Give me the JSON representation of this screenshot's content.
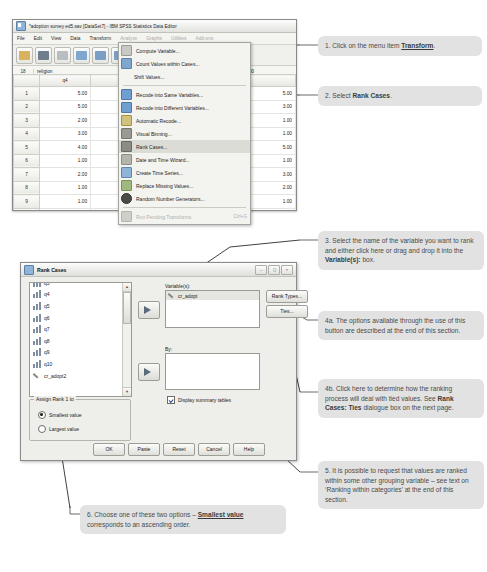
{
  "spss_window": {
    "title": "*adoption survey ed5.sav [DataSet7] - IBM SPSS Statistics Data Editor",
    "title_icon": "spss-data-icon",
    "menus": [
      {
        "label": "File",
        "dim": false
      },
      {
        "label": "Edit",
        "dim": false
      },
      {
        "label": "View",
        "dim": false
      },
      {
        "label": "Data",
        "dim": false
      },
      {
        "label": "Transform",
        "dim": false
      },
      {
        "label": "Analyze",
        "dim": true
      },
      {
        "label": "Graphs",
        "dim": true
      },
      {
        "label": "Utilities",
        "dim": true
      },
      {
        "label": "Add-ons",
        "dim": true
      }
    ],
    "toolbar_icons": [
      "open-file-icon",
      "save-icon",
      "print-icon",
      "recall-dialog-icon",
      "undo-icon",
      "redo-icon",
      "goto-case-icon",
      "variables-icon",
      "find-icon"
    ],
    "cell_bar": {
      "row_ref": "18",
      "variable": "religion",
      "value": "3.00"
    },
    "grid": {
      "columns": [
        "q4"
      ],
      "rows": [
        {
          "num": "1",
          "q4": "5.00",
          "right": "5.00"
        },
        {
          "num": "2",
          "q4": "5.00",
          "right": "3.00"
        },
        {
          "num": "3",
          "q4": "2.00",
          "right": "1.00"
        },
        {
          "num": "4",
          "q4": "3.00",
          "right": "1.00"
        },
        {
          "num": "5",
          "q4": "4.00",
          "right": "5.00"
        },
        {
          "num": "6",
          "q4": "1.00",
          "right": "1.00"
        },
        {
          "num": "7",
          "q4": "2.00",
          "right": "3.00"
        },
        {
          "num": "8",
          "q4": "1.00",
          "right": "2.00"
        },
        {
          "num": "9",
          "q4": "1.00",
          "right": "1.00"
        },
        {
          "num": "10",
          "q4": "2.00",
          "right": "3.00"
        },
        {
          "num": "11",
          "q4": "5.00",
          "right": "5.00"
        },
        {
          "num": "12",
          "q4": "2.00",
          "right": "3.00"
        }
      ],
      "last_row_extra": [
        "4.00",
        "3.00",
        "4.00"
      ]
    }
  },
  "transform_menu": {
    "items": [
      {
        "label": "Compute Variable...",
        "icon": "compute-variable-icon",
        "selected": false,
        "disabled": false,
        "sep_after": false,
        "shortcut": ""
      },
      {
        "label": "Count Values within Cases...",
        "icon": "count-values-icon",
        "selected": false,
        "disabled": false,
        "sep_after": false,
        "shortcut": ""
      },
      {
        "label": "Shift Values...",
        "icon": "none",
        "selected": false,
        "disabled": false,
        "sep_after": true,
        "shortcut": ""
      },
      {
        "label": "Recode into Same Variables...",
        "icon": "recode-same-icon",
        "selected": false,
        "disabled": false,
        "sep_after": false,
        "shortcut": ""
      },
      {
        "label": "Recode into Different Variables...",
        "icon": "recode-different-icon",
        "selected": false,
        "disabled": false,
        "sep_after": false,
        "shortcut": ""
      },
      {
        "label": "Automatic Recode...",
        "icon": "automatic-recode-icon",
        "selected": false,
        "disabled": false,
        "sep_after": false,
        "shortcut": ""
      },
      {
        "label": "Visual Binning...",
        "icon": "visual-binning-icon",
        "selected": false,
        "disabled": false,
        "sep_after": false,
        "shortcut": ""
      },
      {
        "label": "Rank Cases...",
        "icon": "rank-cases-icon",
        "selected": true,
        "disabled": false,
        "sep_after": false,
        "shortcut": ""
      },
      {
        "label": "Date and Time Wizard...",
        "icon": "date-time-wizard-icon",
        "selected": false,
        "disabled": false,
        "sep_after": false,
        "shortcut": ""
      },
      {
        "label": "Create Time Series...",
        "icon": "create-time-series-icon",
        "selected": false,
        "disabled": false,
        "sep_after": false,
        "shortcut": ""
      },
      {
        "label": "Replace Missing Values...",
        "icon": "replace-missing-icon",
        "selected": false,
        "disabled": false,
        "sep_after": false,
        "shortcut": ""
      },
      {
        "label": "Random Number Generators...",
        "icon": "random-number-icon",
        "selected": false,
        "disabled": false,
        "sep_after": true,
        "shortcut": ""
      },
      {
        "label": "Run Pending Transforms",
        "icon": "run-pending-icon",
        "selected": false,
        "disabled": true,
        "sep_after": false,
        "shortcut": "Ctrl+G"
      }
    ]
  },
  "rank_dialog": {
    "title": "Rank Cases",
    "title_icon": "rank-cases-dialog-icon",
    "window_buttons": [
      "minimize-button",
      "maximize-button",
      "close-button"
    ],
    "source_variables": [
      {
        "name": "q3",
        "icon": "scale-variable-icon"
      },
      {
        "name": "q4",
        "icon": "scale-variable-icon"
      },
      {
        "name": "q5",
        "icon": "scale-variable-icon"
      },
      {
        "name": "q6",
        "icon": "scale-variable-icon"
      },
      {
        "name": "q7",
        "icon": "scale-variable-icon"
      },
      {
        "name": "q8",
        "icon": "scale-variable-icon"
      },
      {
        "name": "q9",
        "icon": "scale-variable-icon"
      },
      {
        "name": "q10",
        "icon": "scale-variable-icon"
      },
      {
        "name": "cr_adopt2",
        "icon": "string-variable-icon"
      }
    ],
    "variables_label": "Variable(s):",
    "variables_selected": [
      {
        "name": "cr_adopt",
        "icon": "string-variable-icon"
      }
    ],
    "by_label": "By:",
    "by_selected": [],
    "rank_types_button": "Rank Types...",
    "ties_button": "Ties...",
    "display_summary_label": "Display summary tables",
    "display_summary_checked": true,
    "assign_group_label": "Assign Rank 1 to",
    "assign_options": [
      {
        "label": "Smallest value",
        "selected": true
      },
      {
        "label": "Largest value",
        "selected": false
      }
    ],
    "buttons": [
      "OK",
      "Paste",
      "Reset",
      "Cancel",
      "Help"
    ]
  },
  "callouts": {
    "c1": {
      "prefix": "1. Click on the menu item ",
      "bold": "Transform",
      "suffix": "."
    },
    "c2": {
      "prefix": "2. Select ",
      "bold": "Rank Cases",
      "suffix": "."
    },
    "c3": {
      "prefix": "3. Select the name of the variable you want to rank and either click here or drag and drop it into the ",
      "bold": "Variable(s):",
      "suffix": " box."
    },
    "c4a": {
      "text": "4a. The options available through the use of this button are described at the end of this section."
    },
    "c4b": {
      "prefix": "4b. Click here to determine how the ranking process will deal with tied values. See ",
      "bold": "Rank Cases: Ties",
      "suffix": " dialogue box on the next page."
    },
    "c5": {
      "text": "5. It is possible to request that values are ranked within some other grouping variable – see text on ‘Ranking within categories’ at the end of this section."
    },
    "c6": {
      "prefix": "6. Choose one of these two options – ",
      "bold": "Smallest value",
      "suffix": " corresponds to an ascending order."
    }
  },
  "colors": {
    "callout_bg": "#e2e2e2",
    "dialog_bg": "#eeeeea",
    "menu_highlight": "#dcdcd7",
    "leader_line": "#6b6b6b"
  }
}
